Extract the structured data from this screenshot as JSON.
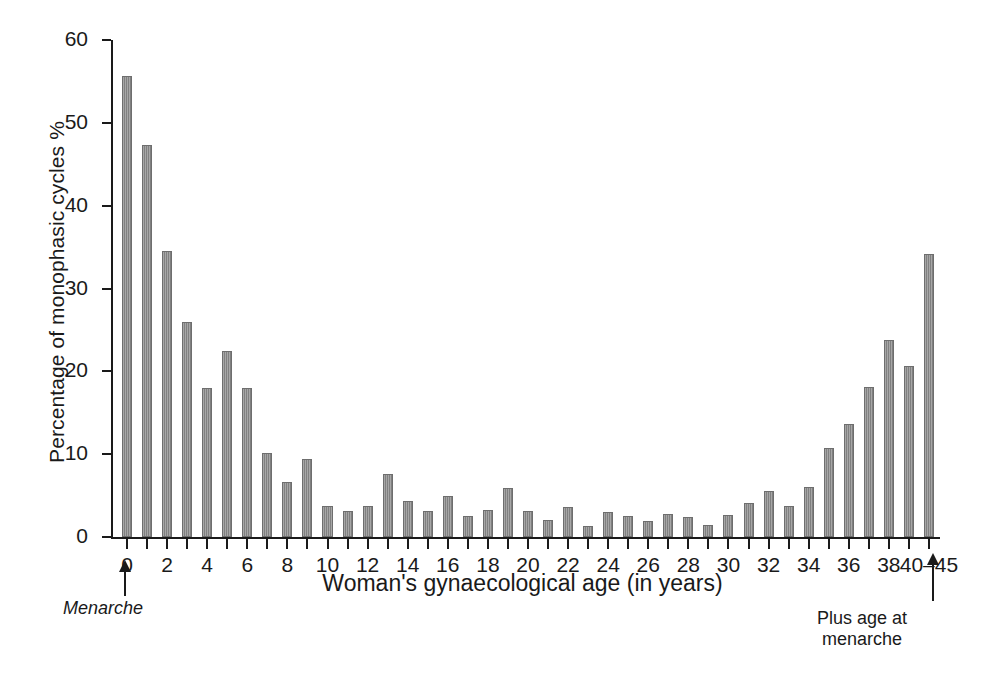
{
  "chart_data": {
    "type": "bar",
    "title": "",
    "xlabel": "Woman's gynaecological age (in years)",
    "ylabel": "Percentage of monophasic cycles %",
    "ylim": [
      0,
      60
    ],
    "yticks": [
      0,
      10,
      20,
      30,
      40,
      50,
      60
    ],
    "ytick_labels": [
      "0",
      "10",
      "20",
      "30",
      "40",
      "50",
      "60"
    ],
    "xticks": [
      0,
      2,
      4,
      6,
      8,
      10,
      12,
      14,
      16,
      18,
      20,
      22,
      24,
      26,
      28,
      30,
      32,
      34,
      36,
      38,
      40
    ],
    "xtick_labels": [
      "0",
      "2",
      "4",
      "6",
      "8",
      "10",
      "12",
      "14",
      "16",
      "18",
      "20",
      "22",
      "24",
      "26",
      "28",
      "30",
      "32",
      "34",
      "36",
      "38",
      "40–45"
    ],
    "grid": false,
    "legend": false,
    "bar_color": "#8e8e8e",
    "bar_edge_color": "#6e6e6e",
    "categories": [
      "0",
      "1",
      "2",
      "3",
      "4",
      "5",
      "6",
      "7",
      "8",
      "9",
      "10",
      "11",
      "12",
      "13",
      "14",
      "15",
      "16",
      "17",
      "18",
      "19",
      "20",
      "21",
      "22",
      "23",
      "24",
      "25",
      "26",
      "27",
      "28",
      "29",
      "30",
      "31",
      "32",
      "33",
      "34",
      "35",
      "36",
      "37",
      "38",
      "39",
      "40–45"
    ],
    "values": [
      55.7,
      47.3,
      34.5,
      26.0,
      18.0,
      22.4,
      18.0,
      10.2,
      6.6,
      9.4,
      3.8,
      3.1,
      3.7,
      7.6,
      4.3,
      3.1,
      5.0,
      2.5,
      3.3,
      5.9,
      3.2,
      2.0,
      3.6,
      1.3,
      3.0,
      2.5,
      1.9,
      2.8,
      2.4,
      1.4,
      2.7,
      4.1,
      5.5,
      3.7,
      6.0,
      10.8,
      13.6,
      18.1,
      23.8,
      20.6,
      34.2
    ]
  },
  "annotations": {
    "menarche": "Menarche",
    "plus_age_line1": "Plus age at",
    "plus_age_line2": "menarche"
  }
}
